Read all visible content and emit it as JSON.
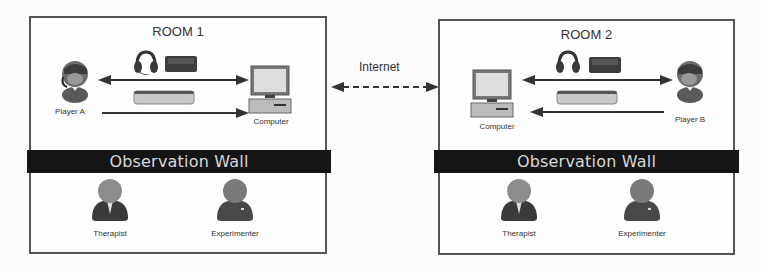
{
  "rooms": [
    {
      "title": "ROOM 1",
      "wall_label": "Observation Wall",
      "player_label": "Player A",
      "computer_label": "Computer",
      "observers": [
        "Therapist",
        "Experimenter"
      ],
      "devices": [
        "headset-icon",
        "game-controller-icon",
        "tabletop-sensor-icon"
      ]
    },
    {
      "title": "ROOM 2",
      "wall_label": "Observation Wall",
      "player_label": "Player B",
      "computer_label": "Computer",
      "observers": [
        "Therapist",
        "Experimenter"
      ],
      "devices": [
        "headset-icon",
        "game-controller-icon",
        "tabletop-sensor-icon"
      ]
    }
  ],
  "connection": {
    "label": "Internet",
    "style": "dashed-bidirectional"
  },
  "colors": {
    "wall": "#151515",
    "wall_text": "#d8d8d8",
    "border": "#555555",
    "arrow": "#333333",
    "person_dark": "#3a3a3a",
    "person_head": "#8a8a8a"
  }
}
